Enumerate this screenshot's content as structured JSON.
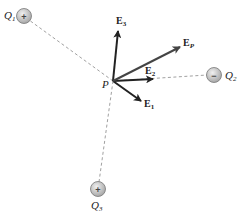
{
  "diagram": {
    "point": {
      "label": "P",
      "x": 113,
      "y": 81
    },
    "charges": [
      {
        "id": "Q1",
        "label": "Q",
        "sub": "1",
        "sign": "+",
        "x": 24,
        "y": 16
      },
      {
        "id": "Q2",
        "label": "Q",
        "sub": "2",
        "sign": "−",
        "x": 214,
        "y": 75
      },
      {
        "id": "Q3",
        "label": "Q",
        "sub": "3",
        "sign": "+",
        "x": 98,
        "y": 189
      }
    ],
    "vectors": [
      {
        "id": "E1",
        "label": "E",
        "sub": "1",
        "x2": 141,
        "y2": 101
      },
      {
        "id": "E2",
        "label": "E",
        "sub": "2",
        "x2": 153,
        "y2": 79
      },
      {
        "id": "E3",
        "label": "E",
        "sub": "3",
        "x2": 118,
        "y2": 31
      },
      {
        "id": "EP",
        "label": "E",
        "sub": "P",
        "x2": 180,
        "y2": 47
      }
    ],
    "colors": {
      "vector": "#222222",
      "resultant": "#444444",
      "dashed": "#888888",
      "charge_fill": "#c8c8c8"
    }
  }
}
